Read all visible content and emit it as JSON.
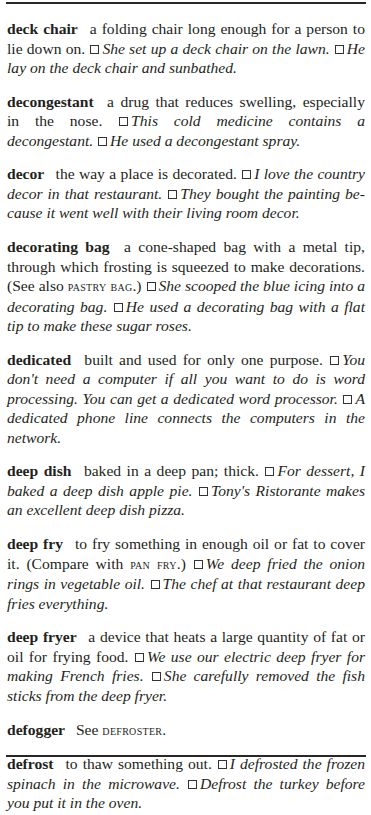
{
  "entries": [
    {
      "headword": "deck chair",
      "parts": [
        {
          "type": "def",
          "text": "a folding chair long enough for a person to lie down on."
        },
        {
          "type": "box"
        },
        {
          "type": "ex",
          "text": "She set up a deck chair on the lawn."
        },
        {
          "type": "box"
        },
        {
          "type": "ex",
          "text": "He lay on the deck chair and sunbathed."
        }
      ]
    },
    {
      "headword": "decongestant",
      "parts": [
        {
          "type": "def",
          "text": "a drug that reduces swelling, especially in the nose."
        },
        {
          "type": "box"
        },
        {
          "type": "ex",
          "text": "This cold medicine contains a decongestant."
        },
        {
          "type": "box"
        },
        {
          "type": "ex",
          "text": "He used a decongestant spray."
        }
      ]
    },
    {
      "headword": "decor",
      "parts": [
        {
          "type": "def",
          "text": "the way a place is decorated."
        },
        {
          "type": "box"
        },
        {
          "type": "ex",
          "text": "I love the country decor in that restaurant."
        },
        {
          "type": "box"
        },
        {
          "type": "ex",
          "text": "They bought the painting be­cause it went well with their living room decor."
        }
      ]
    },
    {
      "headword": "decorating bag",
      "parts": [
        {
          "type": "def",
          "text": "a cone-shaped bag with a metal tip, through which frosting is squeezed to make decorations. (See also "
        },
        {
          "type": "xref",
          "text": "PASTRY BAG"
        },
        {
          "type": "def",
          "text": ".)"
        },
        {
          "type": "box"
        },
        {
          "type": "ex",
          "text": "She scooped the blue icing into a decorating bag."
        },
        {
          "type": "box"
        },
        {
          "type": "ex",
          "text": "He used a decorating bag with a flat tip to make these sugar roses."
        }
      ]
    },
    {
      "headword": "dedicated",
      "parts": [
        {
          "type": "def",
          "text": "built and used for only one purpose."
        },
        {
          "type": "box"
        },
        {
          "type": "ex",
          "text": "You don't need a computer if all you want to do is word process­ing. You can get a dedicated word processor."
        },
        {
          "type": "box"
        },
        {
          "type": "ex",
          "text": "A dedicated phone line connects the computers in the network."
        }
      ]
    },
    {
      "headword": "deep dish",
      "parts": [
        {
          "type": "def",
          "text": "baked in a deep pan; thick."
        },
        {
          "type": "box"
        },
        {
          "type": "ex",
          "text": "For dessert, I baked a deep dish apple pie."
        },
        {
          "type": "box"
        },
        {
          "type": "ex",
          "text": "Tony's Ristorante makes an excellent deep dish pizza."
        }
      ]
    },
    {
      "headword": "deep fry",
      "parts": [
        {
          "type": "def",
          "text": "to fry something in enough oil or fat to cover it. (Compare with "
        },
        {
          "type": "xref",
          "text": "PAN FRY"
        },
        {
          "type": "def",
          "text": ".)"
        },
        {
          "type": "box"
        },
        {
          "type": "ex",
          "text": "We deep fried the onion rings in vegetable oil."
        },
        {
          "type": "box"
        },
        {
          "type": "ex",
          "text": "The chef at that restaurant deep fries everything."
        }
      ]
    },
    {
      "headword": "deep fryer",
      "parts": [
        {
          "type": "def",
          "text": "a device that heats a large quantity of fat or oil for frying food."
        },
        {
          "type": "box"
        },
        {
          "type": "ex",
          "text": "We use our electric deep fryer for making French fries."
        },
        {
          "type": "box"
        },
        {
          "type": "ex",
          "text": "She carefully removed the fish sticks from the deep fryer."
        }
      ]
    },
    {
      "headword": "defogger",
      "parts": [
        {
          "type": "def",
          "text": "See "
        },
        {
          "type": "xref",
          "text": "DEFROSTER"
        },
        {
          "type": "def",
          "text": "."
        }
      ]
    },
    {
      "headword": "defrost",
      "parts": [
        {
          "type": "def",
          "text": "to thaw something out."
        },
        {
          "type": "box"
        },
        {
          "type": "ex",
          "text": "I defrosted the frozen spinach in the microwave."
        },
        {
          "type": "box"
        },
        {
          "type": "ex",
          "text": "Defrost the turkey before you put it in the oven."
        }
      ]
    }
  ]
}
